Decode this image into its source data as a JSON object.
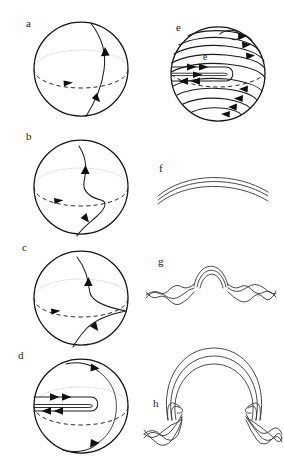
{
  "figure": {
    "kind": "scientific-diagram",
    "background_color": "#ffffff",
    "line_color": "#1b1b1b",
    "outline_color": "#131313",
    "dash_color": "#2b2b2b",
    "arrow_color": "#101010",
    "width": 284,
    "height": 466,
    "columns": 2,
    "rows": 4
  },
  "panels": [
    {
      "id": "a",
      "label": "a",
      "label_x": 26,
      "label_y": 18,
      "column": "left",
      "row": 1,
      "type": "sphere-with-meridional-fieldline",
      "subject": "Initial poloidal field line crossing the equator",
      "sphere": {
        "cx": 81,
        "cy": 69,
        "r": 47
      },
      "equator": {
        "visible": true,
        "style": "dashed",
        "direction": "eastward"
      },
      "field_lines": 1,
      "arrow_count": 3
    },
    {
      "id": "b",
      "label": "b",
      "label_x": 26,
      "label_y": 131,
      "column": "left",
      "row": 2,
      "type": "sphere-with-sheared-fieldline",
      "subject": "Field line sheared by differential rotation",
      "sphere": {
        "cx": 81,
        "cy": 187,
        "r": 47
      },
      "equator": {
        "visible": true,
        "style": "dashed",
        "direction": "eastward"
      },
      "field_lines": 1,
      "arrow_count": 3
    },
    {
      "id": "c",
      "label": "c",
      "label_x": 22,
      "label_y": 242,
      "column": "left",
      "row": 3,
      "type": "sphere-with-stretched-fieldline",
      "subject": "Further stretching forms a cusp at the equator",
      "sphere": {
        "cx": 81,
        "cy": 298,
        "r": 47
      },
      "equator": {
        "visible": true,
        "style": "dashed",
        "direction": "eastward"
      },
      "field_lines": 1,
      "arrow_count": 3
    },
    {
      "id": "d",
      "label": "d",
      "label_x": 18,
      "label_y": 350,
      "column": "left",
      "row": 4,
      "type": "sphere-with-toroidal-loop",
      "subject": "Toroidal loop formed astride the equator with antiparallel legs",
      "sphere": {
        "cx": 81,
        "cy": 406,
        "r": 47
      },
      "equator": {
        "visible": true,
        "style": "dashed",
        "direction": "eastward"
      },
      "field_lines": 3,
      "arrow_count": 5
    },
    {
      "id": "e",
      "label": "e",
      "inner_label": "e",
      "label_x": 176,
      "label_y": 22,
      "inner_label_x": 203,
      "inner_label_y": 53,
      "column": "right",
      "row": 1,
      "type": "sphere-with-wound-toroidal-field",
      "subject": "Repeated winding generates a strongly toroidal banded field",
      "sphere": {
        "cx": 218,
        "cy": 74,
        "r": 47
      },
      "equator": {
        "visible": true,
        "style": "dashed",
        "direction": "eastward"
      },
      "latitude_bands": 11,
      "arrow_count": 12
    },
    {
      "id": "f",
      "label": "f",
      "label_x": 159,
      "label_y": 163,
      "column": "right",
      "row": 2,
      "type": "parallel-arcs",
      "subject": "Untwisted horizontal flux bundle at the base of the convection zone",
      "arc_count": 3,
      "arrow_count": 0
    },
    {
      "id": "g",
      "label": "g",
      "label_x": 158,
      "label_y": 256,
      "column": "right",
      "row": 3,
      "type": "twisted-rope-small-arch",
      "subject": "Twisted flux rope develops a small rising arch",
      "arc_count": 3,
      "braid_crossings": 14,
      "arrow_count": 0
    },
    {
      "id": "h",
      "label": "h",
      "label_x": 153,
      "label_y": 398,
      "column": "right",
      "row": 4,
      "type": "twisted-rope-omega-loop",
      "subject": "Buoyant Omega-loop emerges from the twisted rope",
      "arc_count": 3,
      "braid_crossings": 14,
      "arrow_count": 0
    }
  ]
}
